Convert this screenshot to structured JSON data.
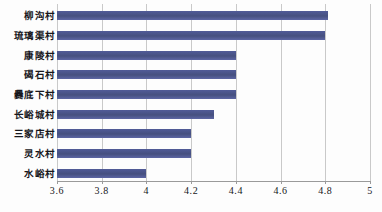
{
  "chart_data": {
    "type": "bar",
    "orientation": "horizontal",
    "title": "",
    "subtitle": "",
    "xlabel": "",
    "ylabel": "",
    "categories": [
      "柳沟村",
      "琉璃渠村",
      "康陵村",
      "碣石村",
      "爨底下村",
      "长峪城村",
      "三家店村",
      "灵水村",
      "水峪村"
    ],
    "values": [
      4.81,
      4.8,
      4.4,
      4.4,
      4.4,
      4.3,
      4.2,
      4.2,
      4.0
    ],
    "series": [
      {
        "name": "",
        "values": [
          4.81,
          4.8,
          4.4,
          4.4,
          4.4,
          4.3,
          4.2,
          4.2,
          4.0
        ]
      }
    ],
    "xlim": [
      3.6,
      5
    ],
    "xticks": [
      3.6,
      3.8,
      4,
      4.2,
      4.4,
      4.6,
      4.8,
      5
    ],
    "xtick_labels": [
      "3.6",
      "3.8",
      "4",
      "4.2",
      "4.4",
      "4.6",
      "4.8",
      "5"
    ],
    "grid": "vertical",
    "legend": "none",
    "bar_color": "#4a5490",
    "gridline_color": "#c9c9c9",
    "axis_color": "#9a9a9a",
    "background": "#ffffff"
  }
}
